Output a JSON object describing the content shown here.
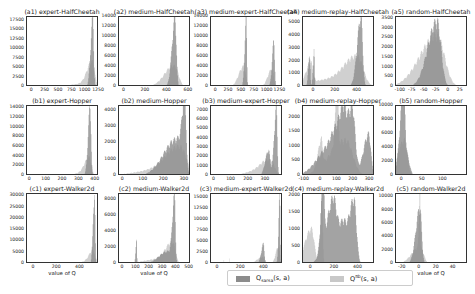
{
  "colors": {
    "sarsa": "#8c8c8c",
    "behavior": "#c8c8c8"
  },
  "legend": {
    "sarsa_label": "Q_sarsa(s, a)",
    "behavior_label": "Q^πb(s, a)"
  },
  "chart_data": [
    {
      "type": "histogram",
      "title": "(a1) expert-HalfCheetah",
      "xlabel": "",
      "xticks": [
        "0",
        "250",
        "500",
        "750",
        "1000",
        "1250"
      ],
      "xlim": [
        -100,
        1250
      ],
      "yticks": [
        "0",
        "2500",
        "5000",
        "7500",
        "10000",
        "12500",
        "15000",
        "17500"
      ],
      "ylim": [
        0,
        18500
      ],
      "series": [
        {
          "name": "Q_sarsa",
          "peaks": [
            [
              1130,
              18000,
              25
            ]
          ]
        },
        {
          "name": "Q^πb",
          "peaks": [
            [
              1120,
              6000,
              60
            ],
            [
              1000,
              800,
              200
            ]
          ]
        }
      ]
    },
    {
      "type": "histogram",
      "title": "(a2) medium-HalfCheetah",
      "xlabel": "",
      "xticks": [
        "0",
        "200",
        "400",
        "600"
      ],
      "xlim": [
        -50,
        620
      ],
      "yticks": [
        "0",
        "2000",
        "4000",
        "6000",
        "8000",
        "10000",
        "12000",
        "14000"
      ],
      "ylim": [
        0,
        14000
      ],
      "series": [
        {
          "name": "Q_sarsa",
          "peaks": [
            [
              470,
              13500,
              18
            ]
          ]
        },
        {
          "name": "Q^πb",
          "peaks": [
            [
              470,
              3500,
              50
            ],
            [
              420,
              1000,
              60
            ]
          ]
        }
      ]
    },
    {
      "type": "histogram",
      "title": "(a3) medium-expert-HalfCheetah",
      "xlabel": "",
      "xticks": [
        "0",
        "250",
        "500",
        "750",
        "1000",
        "1250"
      ],
      "xlim": [
        -100,
        1300
      ],
      "yticks": [
        "0",
        "2000",
        "4000",
        "6000",
        "8000",
        "10000",
        "12000",
        "14000"
      ],
      "ylim": [
        0,
        14000
      ],
      "series": [
        {
          "name": "Q_sarsa",
          "peaks": [
            [
              580,
              13500,
              18
            ],
            [
              1120,
              9000,
              22
            ]
          ]
        },
        {
          "name": "Q^πb",
          "peaks": [
            [
              530,
              4000,
              60
            ],
            [
              1080,
              3500,
              50
            ]
          ]
        }
      ]
    },
    {
      "type": "histogram",
      "title": "(a4) medium-replay-HalfCheetah",
      "xlabel": "",
      "xticks": [
        "0",
        "200",
        "400"
      ],
      "xlim": [
        -100,
        560
      ],
      "yticks": [
        "0",
        "1000",
        "2000",
        "3000",
        "4000",
        "5000"
      ],
      "ylim": [
        0,
        5500
      ],
      "series": [
        {
          "name": "Q_sarsa",
          "peaks": [
            [
              430,
              5400,
              22
            ],
            [
              0,
              2900,
              6
            ],
            [
              -40,
              2500,
              8
            ]
          ]
        },
        {
          "name": "Q^πb",
          "peaks": [
            [
              400,
              2000,
              70
            ],
            [
              250,
              600,
              200
            ],
            [
              -30,
              1500,
              25
            ]
          ]
        }
      ]
    },
    {
      "type": "histogram",
      "title": "(a5) random-HalfCheetah",
      "xlabel": "",
      "xticks": [
        "-100",
        "-75",
        "-50",
        "-25",
        "0",
        "25"
      ],
      "xlim": [
        -110,
        40
      ],
      "yticks": [
        "0",
        "500",
        "1000",
        "1500",
        "2000",
        "2500",
        "3000",
        "3500"
      ],
      "ylim": [
        0,
        3600
      ],
      "series": [
        {
          "name": "Q_sarsa",
          "peaks": [
            [
              -25,
              3300,
              12
            ]
          ]
        },
        {
          "name": "Q^πb",
          "peaks": [
            [
              -25,
              2600,
              22
            ]
          ]
        }
      ]
    },
    {
      "type": "histogram",
      "title": "(b1) expert-Hopper",
      "xlabel": "",
      "xticks": [
        "0",
        "100",
        "200",
        "300",
        "400"
      ],
      "xlim": [
        -20,
        420
      ],
      "yticks": [
        "0",
        "2000",
        "4000",
        "6000",
        "8000",
        "10000",
        "12000",
        "14000"
      ],
      "ylim": [
        0,
        14500
      ],
      "series": [
        {
          "name": "Q_sarsa",
          "peaks": [
            [
              365,
              14200,
              8
            ]
          ]
        },
        {
          "name": "Q^πb",
          "peaks": [
            [
              360,
              3500,
              18
            ],
            [
              320,
              500,
              50
            ]
          ]
        }
      ]
    },
    {
      "type": "histogram",
      "title": "(b2) medium-Hopper",
      "xlabel": "",
      "xticks": [
        "0",
        "100",
        "200",
        "300"
      ],
      "xlim": [
        -20,
        330
      ],
      "yticks": [
        "0",
        "1000",
        "2000",
        "3000",
        "4000"
      ],
      "ylim": [
        0,
        4300
      ],
      "series": [
        {
          "name": "Q_sarsa",
          "peaks": [
            [
              300,
              4200,
              8
            ],
            [
              260,
              2200,
              40
            ]
          ]
        },
        {
          "name": "Q^πb",
          "peaks": [
            [
              280,
              1600,
              40
            ],
            [
              200,
              400,
              80
            ]
          ]
        }
      ]
    },
    {
      "type": "histogram",
      "title": "(b3) medium-expert-Hopper",
      "xlabel": "",
      "xticks": [
        "0",
        "100",
        "200",
        "300"
      ],
      "xlim": [
        -20,
        400
      ],
      "yticks": [
        "0",
        "1000",
        "2000",
        "3000",
        "4000",
        "5000",
        "6000",
        "7000"
      ],
      "ylim": [
        0,
        7500
      ],
      "series": [
        {
          "name": "Q_sarsa",
          "peaks": [
            [
              360,
              7200,
              8
            ],
            [
              315,
              2700,
              12
            ]
          ]
        },
        {
          "name": "Q^πb",
          "peaks": [
            [
              330,
              1500,
              30
            ],
            [
              270,
              600,
              50
            ]
          ]
        }
      ]
    },
    {
      "type": "histogram",
      "title": "(b4) medium-replay-Hopper",
      "xlabel": "",
      "xticks": [
        "-100",
        "0",
        "100",
        "200",
        "300"
      ],
      "xlim": [
        -110,
        330
      ],
      "yticks": [
        "0",
        "500",
        "1000",
        "1500",
        "2000"
      ],
      "ylim": [
        0,
        2400
      ],
      "series": [
        {
          "name": "Q_sarsa",
          "peaks": [
            [
              190,
              2300,
              25
            ],
            [
              130,
              1500,
              25
            ],
            [
              290,
              1400,
              20
            ],
            [
              60,
              1000,
              50
            ]
          ]
        },
        {
          "name": "Q^πb",
          "peaks": [
            [
              100,
              2000,
              8
            ],
            [
              0,
              900,
              12
            ],
            [
              150,
              1200,
              60
            ]
          ]
        }
      ]
    },
    {
      "type": "histogram",
      "title": "(b5) random-Hopper",
      "xlabel": "",
      "xticks": [
        "0",
        "50",
        "100"
      ],
      "xlim": [
        -15,
        160
      ],
      "yticks": [
        "0",
        "2000",
        "4000",
        "6000",
        "8000",
        "10000"
      ],
      "ylim": [
        0,
        10000
      ],
      "series": [
        {
          "name": "Q_sarsa",
          "peaks": [
            [
              3,
              9800,
              5
            ],
            [
              10,
              3000,
              10
            ]
          ]
        },
        {
          "name": "Q^πb",
          "peaks": [
            [
              5,
              5000,
              10
            ]
          ]
        }
      ]
    },
    {
      "type": "histogram",
      "title": "(c1) expert-Walker2d",
      "xlabel": "value of Q",
      "xticks": [
        "0",
        "200",
        "400"
      ],
      "xlim": [
        -60,
        560
      ],
      "yticks": [
        "0",
        "5000",
        "10000",
        "15000",
        "20000",
        "25000",
        "30000"
      ],
      "ylim": [
        0,
        31000
      ],
      "series": [
        {
          "name": "Q_sarsa",
          "peaks": [
            [
              520,
              30500,
              8
            ]
          ]
        },
        {
          "name": "Q^πb",
          "peaks": [
            [
              510,
              5000,
              20
            ],
            [
              480,
              1500,
              40
            ]
          ]
        }
      ]
    },
    {
      "type": "histogram",
      "title": "(c2) medium-Walker2d",
      "xlabel": "value of Q",
      "xticks": [
        "0",
        "100",
        "200",
        "300",
        "400",
        "500"
      ],
      "xlim": [
        -30,
        510
      ],
      "yticks": [
        "0",
        "2000",
        "4000",
        "6000",
        "8000"
      ],
      "ylim": [
        0,
        8700
      ],
      "series": [
        {
          "name": "Q_sarsa",
          "peaks": [
            [
              385,
              8300,
              10
            ],
            [
              100,
              3200,
              4
            ],
            [
              330,
              1500,
              40
            ]
          ]
        },
        {
          "name": "Q^πb",
          "peaks": [
            [
              370,
              2500,
              30
            ],
            [
              280,
              600,
              80
            ]
          ]
        }
      ]
    },
    {
      "type": "histogram",
      "title": "(c3) medium-expert-Walker2d",
      "xlabel": "",
      "xticks": [
        "0",
        "200",
        "400"
      ],
      "xlim": [
        -60,
        560
      ],
      "yticks": [
        "0",
        "2500",
        "5000",
        "7500",
        "10000",
        "12500",
        "15000"
      ],
      "ylim": [
        0,
        16000
      ],
      "series": [
        {
          "name": "Q_sarsa",
          "peaks": [
            [
              530,
              15500,
              6
            ],
            [
              390,
              4500,
              12
            ]
          ]
        },
        {
          "name": "Q^πb",
          "peaks": [
            [
              520,
              4000,
              15
            ],
            [
              380,
              1500,
              30
            ],
            [
              50,
              1000,
              2
            ],
            [
              100,
              1200,
              2
            ]
          ]
        }
      ]
    },
    {
      "type": "histogram",
      "title": "(c4) medium-replay-Walker2d",
      "xlabel": "value of Q",
      "xticks": [
        "0",
        "200",
        "400"
      ],
      "xlim": [
        -70,
        540
      ],
      "yticks": [
        "0",
        "500",
        "1000",
        "1500",
        "2000"
      ],
      "ylim": [
        0,
        2050
      ],
      "series": [
        {
          "name": "Q_sarsa",
          "peaks": [
            [
              360,
              1850,
              30
            ],
            [
              180,
              1450,
              40
            ],
            [
              100,
              1850,
              12
            ],
            [
              260,
              1000,
              40
            ]
          ]
        },
        {
          "name": "Q^πb",
          "peaks": [
            [
              0,
              1000,
              35
            ],
            [
              90,
              1800,
              10
            ]
          ]
        }
      ]
    },
    {
      "type": "histogram",
      "title": "(c5) random-Walker2d",
      "xlabel": "value of Q",
      "xticks": [
        "-20",
        "0",
        "20",
        "40"
      ],
      "xlim": [
        -28,
        57
      ],
      "yticks": [
        "0",
        "2000",
        "4000",
        "6000",
        "8000",
        "10000"
      ],
      "ylim": [
        0,
        10500
      ],
      "series": [
        {
          "name": "Q_sarsa",
          "peaks": [
            [
              0,
              8200,
              3
            ]
          ]
        },
        {
          "name": "Q^πb",
          "peaks": [
            [
              0,
              10000,
              0.6
            ],
            [
              0,
              2500,
              6
            ]
          ]
        }
      ]
    }
  ]
}
